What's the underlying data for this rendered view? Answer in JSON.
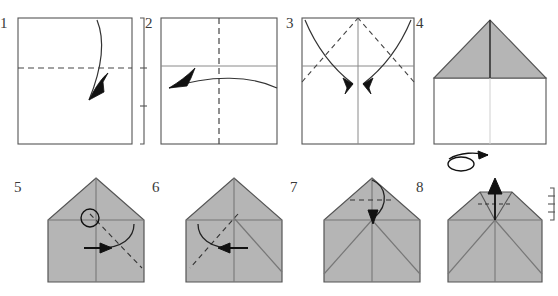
{
  "document": {
    "title": "Paper Airplane Folding Instructions",
    "type": "origami-diagram",
    "width": 558,
    "height": 296,
    "background_color": "#ffffff"
  },
  "colors": {
    "paper_front": "#ffffff",
    "paper_back": "#b5b5b5",
    "outline": "#555555",
    "crease_solid": "#8a8a8a",
    "crease_dashed": "#444444",
    "arrow": "#111111",
    "label_text": "#3a3a3a",
    "bracket": "#555555"
  },
  "legend": {
    "dashed_line_meaning": "valley fold line",
    "solid_thin_line_meaning": "existing crease",
    "arrow_meaning": "fold direction",
    "loop_arrow_meaning": "turn model over",
    "circle_meaning": "reference point",
    "bracket_meaning": "equal divisions"
  },
  "steps": [
    {
      "number": "1",
      "label": "1",
      "shape": "square",
      "fill": "white",
      "description": "Fold square sheet in half horizontally",
      "folds": [
        {
          "kind": "dashed",
          "orientation": "horizontal",
          "position": "middle"
        }
      ],
      "arrow": {
        "kind": "curved",
        "direction": "up",
        "label": "fold-up-arrow"
      },
      "bracket": {
        "present": true,
        "side": "right",
        "ticks": 2,
        "label": "proportion-bracket"
      }
    },
    {
      "number": "2",
      "label": "2",
      "shape": "square",
      "fill": "white",
      "description": "Unfold, then fold in half vertically",
      "folds": [
        {
          "kind": "solid",
          "orientation": "horizontal",
          "position": "upper-third"
        },
        {
          "kind": "dashed",
          "orientation": "vertical",
          "position": "middle"
        }
      ],
      "arrow": {
        "kind": "curved",
        "direction": "left-up",
        "label": "fold-left-arrow"
      },
      "bracket": {
        "present": false,
        "side": "",
        "ticks": 0,
        "label": ""
      }
    },
    {
      "number": "3",
      "label": "3",
      "shape": "square",
      "fill": "white",
      "description": "Fold both top corners down to the center line",
      "folds": [
        {
          "kind": "solid",
          "orientation": "horizontal",
          "position": "upper-third"
        },
        {
          "kind": "solid",
          "orientation": "vertical",
          "position": "middle"
        },
        {
          "kind": "dashed",
          "orientation": "diagonal-left",
          "position": "top-left-corner"
        },
        {
          "kind": "dashed",
          "orientation": "diagonal-right",
          "position": "top-right-corner"
        }
      ],
      "arrow": {
        "kind": "double-curved",
        "direction": "inward-down",
        "label": "fold-corners-arrows"
      },
      "bracket": {
        "present": false,
        "side": "",
        "ticks": 0,
        "label": ""
      }
    },
    {
      "number": "4",
      "label": "4",
      "shape": "house",
      "fill": "gray-top-white-bottom",
      "description": "Resulting house shape; turn the model over",
      "folds": [
        {
          "kind": "solid",
          "orientation": "vertical",
          "position": "middle"
        },
        {
          "kind": "solid",
          "orientation": "horizontal",
          "position": "roof-base"
        }
      ],
      "arrow": {
        "kind": "turn-over",
        "direction": "right",
        "label": "turn-over-symbol"
      },
      "bracket": {
        "present": false,
        "side": "",
        "ticks": 0,
        "label": ""
      }
    },
    {
      "number": "5",
      "label": "5",
      "shape": "pentagon",
      "fill": "gray",
      "description": "Fold the right corner in to the reference point",
      "folds": [
        {
          "kind": "solid",
          "orientation": "vertical",
          "position": "middle"
        },
        {
          "kind": "solid",
          "orientation": "horizontal",
          "position": "roof-base"
        },
        {
          "kind": "dashed",
          "orientation": "diagonal-right",
          "position": "from-apex-area"
        }
      ],
      "arrow": {
        "kind": "curved",
        "direction": "right",
        "label": "fold-right-arrow"
      },
      "reference_circle": {
        "present": true,
        "label": "reference-point-circle"
      },
      "bracket": {
        "present": false,
        "side": "",
        "ticks": 0,
        "label": ""
      }
    },
    {
      "number": "6",
      "label": "6",
      "shape": "pentagon",
      "fill": "gray",
      "description": "Fold the left corner in to the same reference point",
      "folds": [
        {
          "kind": "solid",
          "orientation": "vertical",
          "position": "middle"
        },
        {
          "kind": "solid",
          "orientation": "horizontal",
          "position": "roof-base"
        },
        {
          "kind": "solid",
          "orientation": "diagonal-right",
          "position": "right-flap"
        },
        {
          "kind": "dashed",
          "orientation": "diagonal-left",
          "position": "left-flap"
        }
      ],
      "arrow": {
        "kind": "curved",
        "direction": "left",
        "label": "fold-left-arrow"
      },
      "bracket": {
        "present": false,
        "side": "",
        "ticks": 0,
        "label": ""
      }
    },
    {
      "number": "7",
      "label": "7",
      "shape": "pentagon",
      "fill": "gray",
      "description": "Fold the top point down to the crossing point",
      "folds": [
        {
          "kind": "solid",
          "orientation": "vertical",
          "position": "middle"
        },
        {
          "kind": "solid",
          "orientation": "horizontal",
          "position": "roof-base"
        },
        {
          "kind": "solid",
          "orientation": "diagonal-left",
          "position": "left-flap"
        },
        {
          "kind": "solid",
          "orientation": "diagonal-right",
          "position": "right-flap"
        },
        {
          "kind": "dashed",
          "orientation": "horizontal",
          "position": "near-apex"
        }
      ],
      "arrow": {
        "kind": "curved",
        "direction": "down",
        "label": "fold-tip-down-arrow"
      },
      "bracket": {
        "present": false,
        "side": "",
        "ticks": 0,
        "label": ""
      }
    },
    {
      "number": "8",
      "label": "8",
      "shape": "pentagon-flat-top",
      "fill": "gray",
      "description": "Fold a small part of the tip back up",
      "folds": [
        {
          "kind": "solid",
          "orientation": "vertical",
          "position": "middle"
        },
        {
          "kind": "solid",
          "orientation": "horizontal",
          "position": "roof-base"
        },
        {
          "kind": "solid",
          "orientation": "diagonal-left",
          "position": "left-flap"
        },
        {
          "kind": "solid",
          "orientation": "diagonal-right",
          "position": "right-flap"
        },
        {
          "kind": "dashed",
          "orientation": "horizontal",
          "position": "small-tip"
        }
      ],
      "arrow": {
        "kind": "straight",
        "direction": "up",
        "label": "fold-tip-up-arrow"
      },
      "bracket": {
        "present": true,
        "side": "right",
        "ticks": 3,
        "label": "proportion-bracket"
      }
    }
  ]
}
